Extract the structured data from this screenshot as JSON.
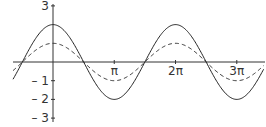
{
  "chart_data": {
    "type": "line",
    "title": "",
    "xlabel": "",
    "ylabel": "",
    "xlim": [
      -2.05,
      10.8
    ],
    "ylim": [
      -3,
      3
    ],
    "grid": false,
    "legend": null,
    "x_ticks": [
      {
        "value": 3.14159,
        "label": "π"
      },
      {
        "value": 6.28319,
        "label": "2π"
      },
      {
        "value": 9.42478,
        "label": "3π"
      }
    ],
    "y_ticks": [
      {
        "value": 3,
        "label": "3"
      },
      {
        "value": -1,
        "label": "– 1"
      },
      {
        "value": -2,
        "label": "– 2"
      },
      {
        "value": -3,
        "label": "– 3"
      }
    ],
    "series": [
      {
        "name": "y = 2cos(x)",
        "function": "2*cos(x)",
        "amplitude": 2,
        "style": "solid",
        "x": [
          -2.05,
          -1.5708,
          0,
          1.5708,
          3.1416,
          4.7124,
          6.2832,
          7.854,
          9.4248,
          10.8
        ],
        "values": [
          -0.92,
          0,
          2,
          0,
          -2,
          0,
          2,
          0,
          -2,
          -0.41
        ]
      },
      {
        "name": "y = cos(x)",
        "function": "cos(x)",
        "amplitude": 1,
        "style": "dashed",
        "x": [
          -2.05,
          -1.5708,
          0,
          1.5708,
          3.1416,
          4.7124,
          6.2832,
          7.854,
          9.4248,
          10.8
        ],
        "values": [
          -0.46,
          0,
          1,
          0,
          -1,
          0,
          1,
          0,
          -1,
          -0.2
        ]
      }
    ]
  },
  "layout": {
    "origin_px": [
      53,
      62
    ],
    "px_per_x_unit": 19.5,
    "px_per_y_unit": 18.7,
    "x_axis_px": [
      13,
      265
    ],
    "y_axis_px": [
      4,
      122
    ]
  }
}
